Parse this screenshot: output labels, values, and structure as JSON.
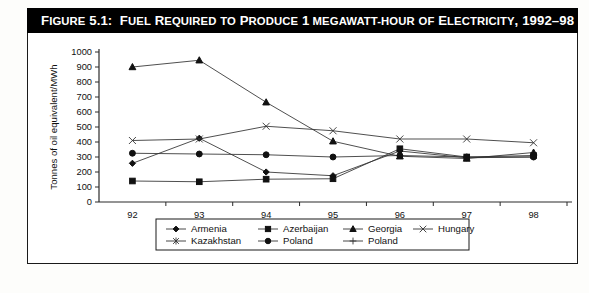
{
  "figure": {
    "title_prefix": "Figure 5.1:",
    "title_text": "Fuel Required to Produce 1 megawatt-hour of Electricity, 1992–98",
    "title_full": "Figure 5.1: Fuel Required to Produce 1 megawatt-hour of Electricity, 1992–98",
    "title_bar_color": "#000000",
    "title_text_color": "#ffffff",
    "frame_color": "#1a1a1a",
    "background": "#ffffff"
  },
  "chart_data": {
    "type": "line",
    "xlabel": "",
    "ylabel": "Tonnes of oil equivalent/MWh",
    "categories": [
      "92",
      "93",
      "94",
      "95",
      "96",
      "97",
      "98"
    ],
    "x_tick_labels": [
      "92",
      "93",
      "94",
      "95",
      "96",
      "97",
      "98"
    ],
    "y_tick_labels": [
      "0",
      "100",
      "200",
      "300",
      "400",
      "500",
      "600",
      "700",
      "800",
      "900",
      "1000"
    ],
    "ylim": [
      0,
      1000
    ],
    "y_tick_step": 100,
    "grid": false,
    "legend_position": "bottom",
    "series": [
      {
        "name": "Armenia",
        "marker": "diamond",
        "values": [
          258,
          425,
          200,
          175,
          340,
          295,
          300
        ]
      },
      {
        "name": "Azerbaijan",
        "marker": "square",
        "values": [
          140,
          135,
          152,
          155,
          355,
          300,
          310
        ]
      },
      {
        "name": "Georgia",
        "marker": "triangle",
        "values": [
          900,
          945,
          665,
          405,
          305,
          290,
          330
        ]
      },
      {
        "name": "Hungary",
        "marker": "cross-x",
        "values": [
          410,
          420,
          505,
          475,
          420,
          420,
          395
        ]
      },
      {
        "name": "Kazakhstan",
        "marker": "asterisk",
        "values": [
          null,
          null,
          null,
          null,
          null,
          null,
          null
        ]
      },
      {
        "name": "Poland",
        "marker": "circle",
        "values": [
          325,
          320,
          315,
          300,
          310,
          300,
          300
        ]
      },
      {
        "name": "Poland",
        "marker": "plus",
        "values": [
          null,
          null,
          null,
          null,
          null,
          null,
          null
        ]
      }
    ]
  },
  "legend": {
    "items": [
      {
        "label": "Armenia",
        "marker": "diamond"
      },
      {
        "label": "Azerbaijan",
        "marker": "square"
      },
      {
        "label": "Georgia",
        "marker": "triangle"
      },
      {
        "label": "Hungary",
        "marker": "cross-x"
      },
      {
        "label": "Kazakhstan",
        "marker": "asterisk"
      },
      {
        "label": "Poland",
        "marker": "circle"
      },
      {
        "label": "Poland",
        "marker": "plus"
      }
    ]
  }
}
